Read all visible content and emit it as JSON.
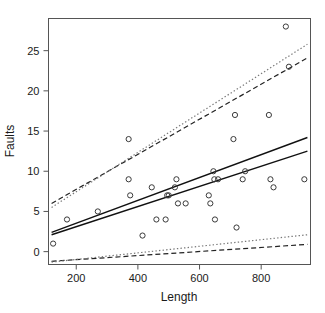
{
  "chart_data": {
    "type": "scatter",
    "title": "",
    "xlabel": "Length",
    "ylabel": "Faults",
    "xlim": [
      110,
      960
    ],
    "ylim": [
      -1.6,
      29.0
    ],
    "grid": false,
    "legend": null,
    "xticks": [
      200,
      400,
      600,
      800
    ],
    "yticks": [
      0,
      5,
      10,
      15,
      20,
      25
    ],
    "points": [
      {
        "x": 125,
        "y": 1
      },
      {
        "x": 170,
        "y": 4
      },
      {
        "x": 270,
        "y": 5
      },
      {
        "x": 370,
        "y": 14
      },
      {
        "x": 370,
        "y": 9
      },
      {
        "x": 375,
        "y": 7
      },
      {
        "x": 415,
        "y": 2
      },
      {
        "x": 445,
        "y": 8
      },
      {
        "x": 460,
        "y": 4
      },
      {
        "x": 490,
        "y": 4
      },
      {
        "x": 495,
        "y": 7
      },
      {
        "x": 500,
        "y": 7
      },
      {
        "x": 525,
        "y": 9
      },
      {
        "x": 520,
        "y": 8
      },
      {
        "x": 530,
        "y": 6
      },
      {
        "x": 555,
        "y": 6
      },
      {
        "x": 630,
        "y": 7
      },
      {
        "x": 635,
        "y": 6
      },
      {
        "x": 645,
        "y": 10
      },
      {
        "x": 648,
        "y": 9
      },
      {
        "x": 650,
        "y": 4
      },
      {
        "x": 660,
        "y": 9
      },
      {
        "x": 710,
        "y": 14
      },
      {
        "x": 715,
        "y": 17
      },
      {
        "x": 720,
        "y": 3
      },
      {
        "x": 740,
        "y": 9
      },
      {
        "x": 748,
        "y": 10
      },
      {
        "x": 825,
        "y": 17
      },
      {
        "x": 830,
        "y": 9
      },
      {
        "x": 840,
        "y": 8
      },
      {
        "x": 880,
        "y": 28
      },
      {
        "x": 890,
        "y": 23
      },
      {
        "x": 940,
        "y": 9
      }
    ],
    "series": [
      {
        "name": "fit-line-upper",
        "style": "solid",
        "points": [
          [
            120,
            2.4
          ],
          [
            950,
            14.2
          ]
        ]
      },
      {
        "name": "fit-line-lower",
        "style": "solid",
        "points": [
          [
            120,
            2.1
          ],
          [
            950,
            12.5
          ]
        ]
      },
      {
        "name": "upper-band-dashed",
        "style": "dashed",
        "points": [
          [
            120,
            6.0
          ],
          [
            950,
            24.1
          ]
        ]
      },
      {
        "name": "upper-band-dotted",
        "style": "dotted",
        "points": [
          [
            120,
            5.5
          ],
          [
            950,
            25.8
          ]
        ]
      },
      {
        "name": "lower-band-dashed",
        "style": "dashed",
        "points": [
          [
            120,
            -1.2
          ],
          [
            950,
            0.9
          ]
        ]
      },
      {
        "name": "lower-band-dotted",
        "style": "dotted",
        "points": [
          [
            120,
            -1.3
          ],
          [
            950,
            2.1
          ]
        ]
      }
    ]
  },
  "axes": {
    "x_title": "Length",
    "y_title": "Faults",
    "x_tick_labels": [
      "200",
      "400",
      "600",
      "800"
    ],
    "y_tick_labels": [
      "0",
      "5",
      "10",
      "15",
      "20",
      "25"
    ]
  },
  "colors": {
    "background": "#ffffff",
    "frame": "#555555",
    "point": "#3a3a3a",
    "line_solid": "#111111",
    "line_dashed": "#222222",
    "line_dotted": "#777777",
    "text": "#1a1a1a"
  }
}
